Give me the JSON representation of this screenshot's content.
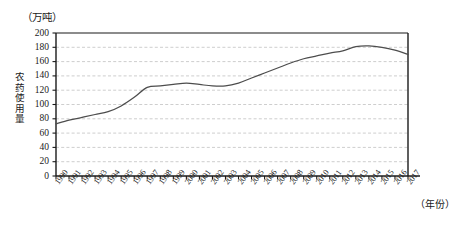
{
  "chart_data": {
    "type": "line",
    "title": "",
    "subtitle": "",
    "xlabel": "（年份）",
    "ylabel": "农药使用量",
    "unit_label": "（万吨）",
    "xlim": [
      1990,
      2017
    ],
    "ylim": [
      0,
      200
    ],
    "grid": true,
    "grid_axis": "y",
    "legend": "none",
    "line_color": "#4d4d4d",
    "grid_color": "#b9b9b9",
    "axis_color": "#1a1a1a",
    "y_ticks": [
      0,
      20,
      40,
      60,
      80,
      100,
      120,
      140,
      160,
      180,
      200
    ],
    "y_tick_labels": [
      "0",
      "20",
      "40",
      "60",
      "80",
      "100",
      "120",
      "140",
      "160",
      "180",
      "200"
    ],
    "categories": [
      "1990",
      "1991",
      "1992",
      "1993",
      "1994",
      "1995",
      "1996",
      "1997",
      "1998",
      "1999",
      "2000",
      "2001",
      "2002",
      "2003",
      "2004",
      "2005",
      "2006",
      "2007",
      "2008",
      "2009",
      "2010",
      "2011",
      "2012",
      "2013",
      "2014",
      "2015",
      "2016",
      "2017"
    ],
    "x": [
      1990,
      1991,
      1992,
      1993,
      1994,
      1995,
      1996,
      1997,
      1998,
      1999,
      2000,
      2001,
      2002,
      2003,
      2004,
      2005,
      2006,
      2007,
      2008,
      2009,
      2010,
      2011,
      2012,
      2013,
      2014,
      2015,
      2016,
      2017
    ],
    "values": [
      73,
      78,
      82,
      86,
      90,
      98,
      110,
      124,
      126,
      128,
      130,
      128,
      126,
      126,
      130,
      137,
      144,
      151,
      158,
      164,
      168,
      172,
      175,
      181,
      182,
      180,
      176,
      170
    ],
    "series": [
      {
        "name": "农药使用量",
        "values": [
          73,
          78,
          82,
          86,
          90,
          98,
          110,
          124,
          126,
          128,
          130,
          128,
          126,
          126,
          130,
          137,
          144,
          151,
          158,
          164,
          168,
          172,
          175,
          181,
          182,
          180,
          176,
          170
        ]
      }
    ]
  }
}
